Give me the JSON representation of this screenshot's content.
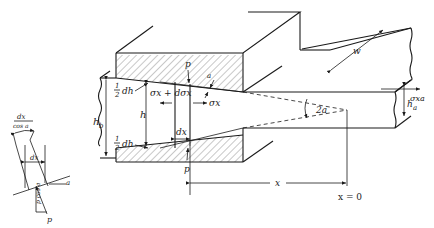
{
  "diagram": {
    "type": "engineering-schematic",
    "labels": {
      "p_top": "p",
      "p_bottom": "p",
      "alpha_top": "a",
      "half_dh_top_num": "1",
      "half_dh_top_den": "2",
      "half_dh_top": "dh",
      "half_dh_bottom_num": "1",
      "half_dh_bottom_den": "2",
      "half_dh_bottom": "dh",
      "hb": "h",
      "hb_sub": "b",
      "h": "h",
      "sigma_left": "σx + dσx",
      "sigma_right": "σx",
      "dx_main": "dx",
      "two_alpha": "2a",
      "w": "w",
      "ha": "h",
      "ha_sub": "a",
      "sigma_xa": "σxa",
      "x": "x",
      "x_zero": "x = 0"
    },
    "inset": {
      "dx_over_cos_num": "dx",
      "dx_over_cos_den": "cos a",
      "dx": "dx",
      "alpha": "a",
      "p_cos": "p cos a",
      "p": "p"
    }
  }
}
